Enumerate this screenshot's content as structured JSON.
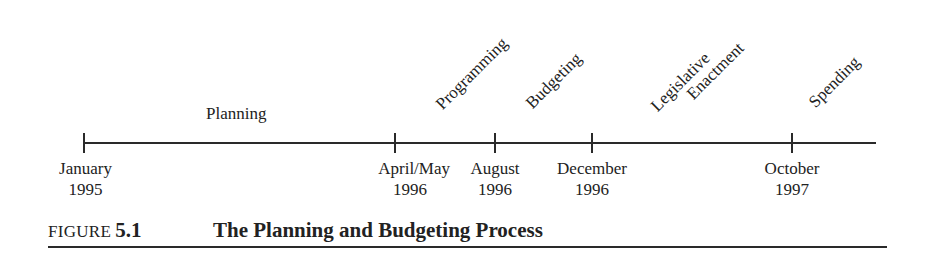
{
  "figure": {
    "label": "FIGURE",
    "number": "5.1",
    "title": "The Planning and Budgeting Process"
  },
  "phases": [
    {
      "label": "Planning"
    },
    {
      "label": "Programming"
    },
    {
      "label": "Budgeting"
    },
    {
      "label": "Legislative",
      "label2": "Enactment"
    },
    {
      "label": "Spending"
    }
  ],
  "dates": [
    {
      "month": "January",
      "year": "1995"
    },
    {
      "month": "April/May",
      "year": "1996"
    },
    {
      "month": "August",
      "year": "1996"
    },
    {
      "month": "December",
      "year": "1996"
    },
    {
      "month": "October",
      "year": "1997"
    }
  ],
  "colors": {
    "ink": "#2a2a2a",
    "background": "#ffffff"
  }
}
